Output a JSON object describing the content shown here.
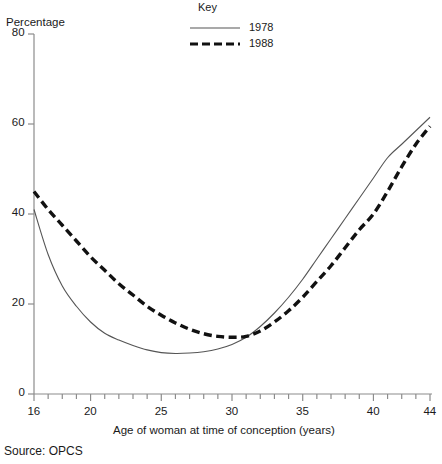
{
  "figure": {
    "y_axis_name": "Percentage",
    "x_axis_title": "Age of woman at time of conception (years)",
    "source_note": "Source: OPCS",
    "legend_title": "Key"
  },
  "chart_data": {
    "type": "line",
    "title": "",
    "xlabel": "Age of woman at time of conception (years)",
    "ylabel": "Percentage",
    "xlim": [
      16,
      44
    ],
    "ylim": [
      0,
      80
    ],
    "grid": false,
    "legend_position": "top-center",
    "x_ticks": [
      16,
      20,
      25,
      30,
      35,
      40,
      44
    ],
    "x_tick_labels": [
      "16",
      "20",
      "25",
      "30",
      "35",
      "40",
      "44"
    ],
    "x_minor_tick_step": 1,
    "y_ticks": [
      0,
      20,
      40,
      60,
      80
    ],
    "y_tick_labels": [
      "0",
      "20",
      "40",
      "60",
      "80"
    ],
    "x": [
      16,
      17,
      18,
      19,
      20,
      21,
      22,
      23,
      24,
      25,
      26,
      27,
      28,
      29,
      30,
      31,
      32,
      33,
      34,
      35,
      36,
      37,
      38,
      39,
      40,
      41,
      42,
      43,
      44
    ],
    "series": [
      {
        "name": "1978",
        "style": "solid",
        "color": "#555555",
        "values": [
          41,
          31,
          24,
          19.5,
          16,
          13.5,
          12,
          10.8,
          9.8,
          9.2,
          9.0,
          9.1,
          9.4,
          10.0,
          11.0,
          12.6,
          15.0,
          18.0,
          21.5,
          25.5,
          30.0,
          34.5,
          39.0,
          43.5,
          48.0,
          52.5,
          55.5,
          58.5,
          61.5
        ]
      },
      {
        "name": "1988",
        "style": "dashed",
        "color": "#111111",
        "values": [
          45,
          41,
          37.5,
          34,
          30.5,
          27.5,
          24.5,
          22.0,
          19.5,
          17.5,
          15.8,
          14.4,
          13.4,
          12.8,
          12.6,
          12.8,
          14.0,
          16.0,
          18.5,
          21.5,
          25.0,
          28.5,
          32.5,
          36.5,
          40.0,
          45.0,
          50.5,
          55.5,
          59.5
        ]
      }
    ]
  },
  "legend": {
    "entries": [
      {
        "label": "1978",
        "style": "solid"
      },
      {
        "label": "1988",
        "style": "dashed"
      }
    ]
  }
}
